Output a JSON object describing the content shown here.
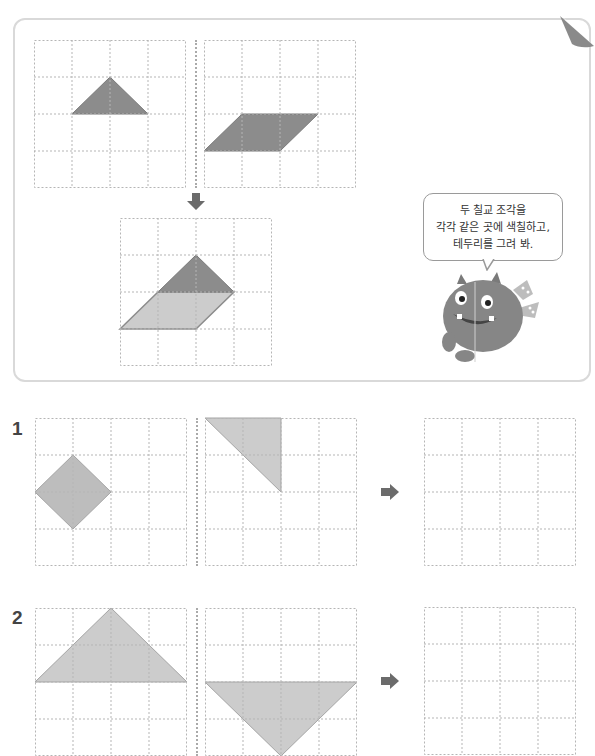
{
  "example": {
    "speech_bubble": {
      "line1": "두 칠교 조각을",
      "line2": "각각 같은 곳에 색칠하고,",
      "line3": "테두리를 그려 봐."
    },
    "grids": [
      {
        "id": "piece-a",
        "cols": 4,
        "rows": 4,
        "shape": "triangle",
        "points": [
          [
            1,
            2
          ],
          [
            2,
            1
          ],
          [
            3,
            2
          ]
        ],
        "fill": "#8c8c8c"
      },
      {
        "id": "piece-b",
        "cols": 4,
        "rows": 4,
        "shape": "parallelogram",
        "points": [
          [
            0,
            3
          ],
          [
            1,
            2
          ],
          [
            3,
            2
          ],
          [
            2,
            3
          ]
        ],
        "fill": "#8c8c8c"
      },
      {
        "id": "combined",
        "cols": 4,
        "rows": 4,
        "shapes": [
          {
            "shape": "triangle",
            "points": [
              [
                1,
                2
              ],
              [
                2,
                1
              ],
              [
                3,
                2
              ]
            ],
            "fill": "#8c8c8c"
          },
          {
            "shape": "parallelogram",
            "points": [
              [
                0,
                3
              ],
              [
                1,
                2
              ],
              [
                3,
                2
              ],
              [
                2,
                3
              ]
            ],
            "fill": "#cccccc"
          }
        ]
      }
    ],
    "down_arrow_icon": "arrow-down"
  },
  "problems": [
    {
      "number": "1",
      "piece_a": {
        "shape": "square-diamond",
        "points": [
          [
            0,
            2
          ],
          [
            1,
            1
          ],
          [
            2,
            2
          ],
          [
            1,
            3
          ]
        ],
        "fill": "#bdbdbd"
      },
      "piece_b": {
        "shape": "right-triangle",
        "points": [
          [
            0,
            0
          ],
          [
            2,
            0
          ],
          [
            2,
            2
          ]
        ],
        "fill": "#cccccc"
      },
      "answer_grid": {
        "cols": 4,
        "rows": 4,
        "filled": false
      },
      "arrow_icon": "arrow-right"
    },
    {
      "number": "2",
      "piece_a": {
        "shape": "large-triangle",
        "points": [
          [
            0,
            2
          ],
          [
            2,
            0
          ],
          [
            4,
            2
          ]
        ],
        "fill": "#cccccc"
      },
      "piece_b": {
        "shape": "large-triangle-inverted",
        "points": [
          [
            0,
            2
          ],
          [
            4,
            2
          ],
          [
            2,
            4
          ]
        ],
        "fill": "#cccccc"
      },
      "answer_grid": {
        "cols": 4,
        "rows": 4,
        "filled": false
      },
      "arrow_icon": "arrow-right"
    }
  ],
  "colors": {
    "grid_line": "#b5b5b5",
    "card_border": "#d9d9d9",
    "dark_piece": "#8c8c8c",
    "light_piece": "#cccccc",
    "arrow": "#6b6b6b"
  }
}
